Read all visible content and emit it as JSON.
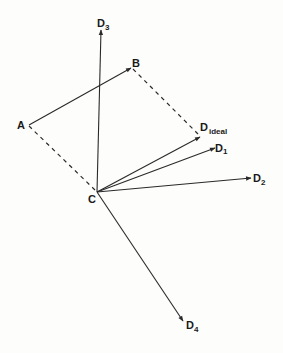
{
  "diagram": {
    "type": "vector-diagram",
    "colors": {
      "line": "#2a2a2a",
      "background": "#fdfdfc"
    },
    "points": {
      "A": {
        "label": "A",
        "x": 29,
        "y": 125
      },
      "B": {
        "label": "B",
        "x": 131,
        "y": 68
      },
      "C": {
        "label": "C",
        "x": 97,
        "y": 192
      }
    },
    "vectors": [
      {
        "id": "AB",
        "from": "A",
        "to": "B",
        "label": ""
      },
      {
        "id": "D3",
        "label": "D",
        "sub": "3",
        "tip": [
          101,
          30
        ]
      },
      {
        "id": "Dideal",
        "label": "D",
        "sub": "ideal",
        "tip": [
          200,
          137
        ]
      },
      {
        "id": "D1",
        "label": "D",
        "sub": "1",
        "tip": [
          215,
          148
        ]
      },
      {
        "id": "D2",
        "label": "D",
        "sub": "2",
        "tip": [
          251,
          178
        ]
      },
      {
        "id": "D4",
        "label": "D",
        "sub": "4",
        "tip": [
          183,
          321
        ]
      }
    ],
    "dashed_lines": [
      {
        "from": "A",
        "to": "C"
      },
      {
        "from": "B",
        "to": "Dideal"
      }
    ],
    "labels": {
      "A": "A",
      "B": "B",
      "C": "C",
      "D3": {
        "main": "D",
        "sub": "3"
      },
      "Dideal": {
        "main": "D",
        "sub": "ideal"
      },
      "D1": {
        "main": "D",
        "sub": "1"
      },
      "D2": {
        "main": "D",
        "sub": "2"
      },
      "D4": {
        "main": "D",
        "sub": "4"
      }
    }
  }
}
